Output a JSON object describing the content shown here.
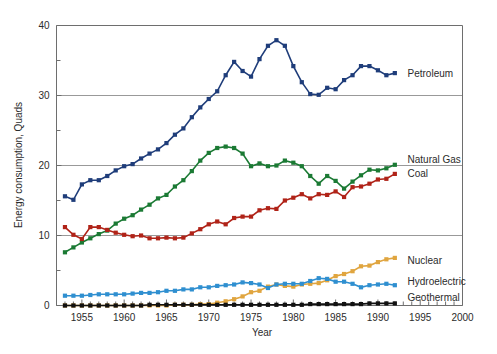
{
  "figure": {
    "background": "#ffffff",
    "width": 497,
    "height": 354
  },
  "chart_data": {
    "type": "line",
    "title": "",
    "xlabel": "Year",
    "ylabel": "Energy consumption, Quads",
    "xlim": [
      1952,
      2000
    ],
    "ylim": [
      0,
      40
    ],
    "xticks": [
      1955,
      1960,
      1965,
      1970,
      1975,
      1980,
      1985,
      1990,
      1995,
      2000
    ],
    "xticklabels": [
      "1955",
      "1960",
      "1965",
      "1970",
      "1975",
      "1980",
      "1985",
      "1990",
      "1995",
      "2000"
    ],
    "xminor_step": 1,
    "yticks": [
      0,
      10,
      20,
      30,
      40
    ],
    "yticklabels": [
      "0",
      "10",
      "20",
      "30",
      "40"
    ],
    "yminor": [
      5,
      15,
      25,
      35
    ],
    "grid": "horizontal-major",
    "grid_color": "#999999",
    "legend_position": "right-of-line-ends",
    "markers": "square",
    "x": [
      1953,
      1954,
      1955,
      1956,
      1957,
      1958,
      1959,
      1960,
      1961,
      1962,
      1963,
      1964,
      1965,
      1966,
      1967,
      1968,
      1969,
      1970,
      1971,
      1972,
      1973,
      1974,
      1975,
      1976,
      1977,
      1978,
      1979,
      1980,
      1981,
      1982,
      1983,
      1984,
      1985,
      1986,
      1987,
      1988,
      1989,
      1990,
      1991,
      1992
    ],
    "series": [
      {
        "name": "Petroleum",
        "color": "#1f3d7a",
        "label": "Petroleum",
        "label_x": 1993.5,
        "label_y": 33.2,
        "values": [
          15.6,
          15.1,
          17.3,
          17.9,
          17.9,
          18.5,
          19.3,
          19.9,
          20.2,
          21.0,
          21.7,
          22.3,
          23.2,
          24.4,
          25.3,
          26.9,
          28.3,
          29.5,
          30.6,
          32.9,
          34.8,
          33.5,
          32.7,
          35.2,
          37.1,
          37.9,
          37.1,
          34.2,
          31.9,
          30.2,
          30.1,
          31.1,
          30.9,
          32.2,
          32.9,
          34.2,
          34.2,
          33.6,
          32.9,
          33.2
        ]
      },
      {
        "name": "Natural Gas",
        "color": "#1b7a34",
        "label": "Natural Gas",
        "label_x": 1993.5,
        "label_y": 20.8,
        "values": [
          7.6,
          8.3,
          9.0,
          9.6,
          10.2,
          10.7,
          11.7,
          12.4,
          12.9,
          13.7,
          14.4,
          15.3,
          15.8,
          17.0,
          17.9,
          19.2,
          20.7,
          21.8,
          22.5,
          22.7,
          22.5,
          21.7,
          19.9,
          20.3,
          19.9,
          20.0,
          20.7,
          20.4,
          19.9,
          18.5,
          17.4,
          18.5,
          17.8,
          16.7,
          17.7,
          18.6,
          19.4,
          19.3,
          19.6,
          20.1
        ]
      },
      {
        "name": "Coal",
        "color": "#b02318",
        "label": "Coal",
        "label_x": 1993.5,
        "label_y": 18.9,
        "values": [
          11.2,
          10.1,
          9.5,
          11.2,
          11.2,
          10.8,
          10.4,
          10.1,
          9.9,
          10.0,
          9.6,
          9.6,
          9.7,
          9.6,
          9.7,
          10.3,
          10.9,
          11.6,
          12.0,
          11.6,
          12.5,
          12.7,
          12.7,
          13.6,
          13.9,
          13.8,
          15.0,
          15.4,
          15.9,
          15.3,
          15.9,
          15.8,
          16.3,
          15.5,
          16.9,
          17.0,
          17.4,
          18.0,
          18.1,
          18.8
        ]
      },
      {
        "name": "Nuclear",
        "color": "#e0a53f",
        "label": "Nuclear",
        "label_x": 1993.5,
        "label_y": 6.5,
        "values": [
          0.0,
          0.0,
          0.0,
          0.0,
          0.0,
          0.0,
          0.0,
          0.0,
          0.0,
          0.0,
          0.0,
          0.0,
          0.0,
          0.1,
          0.1,
          0.1,
          0.2,
          0.2,
          0.4,
          0.6,
          0.9,
          1.3,
          1.9,
          2.1,
          2.7,
          3.0,
          2.8,
          2.7,
          3.0,
          3.1,
          3.2,
          3.6,
          4.2,
          4.5,
          4.9,
          5.6,
          5.7,
          6.2,
          6.6,
          6.8
        ]
      },
      {
        "name": "Hydroelectric",
        "color": "#2f8fd0",
        "label": "Hydroelectric",
        "label_x": 1993.5,
        "label_y": 3.4,
        "values": [
          1.4,
          1.4,
          1.4,
          1.5,
          1.6,
          1.6,
          1.6,
          1.6,
          1.7,
          1.8,
          1.8,
          1.9,
          2.1,
          2.1,
          2.3,
          2.3,
          2.6,
          2.6,
          2.8,
          2.9,
          3.0,
          3.3,
          3.2,
          3.0,
          2.5,
          3.0,
          3.1,
          3.1,
          3.1,
          3.5,
          3.9,
          3.8,
          3.4,
          3.4,
          3.1,
          2.6,
          2.9,
          3.0,
          3.1,
          2.9
        ]
      },
      {
        "name": "Geothermal",
        "color": "#111111",
        "label": "Geothermal",
        "label_x": 1993.5,
        "label_y": 1.1,
        "values": [
          0.0,
          0.0,
          0.0,
          0.0,
          0.0,
          0.0,
          0.0,
          0.0,
          0.0,
          0.0,
          0.1,
          0.1,
          0.1,
          0.1,
          0.1,
          0.1,
          0.1,
          0.1,
          0.1,
          0.1,
          0.1,
          0.1,
          0.1,
          0.1,
          0.1,
          0.1,
          0.1,
          0.1,
          0.1,
          0.2,
          0.2,
          0.2,
          0.2,
          0.2,
          0.2,
          0.2,
          0.3,
          0.3,
          0.3,
          0.3
        ]
      }
    ]
  }
}
